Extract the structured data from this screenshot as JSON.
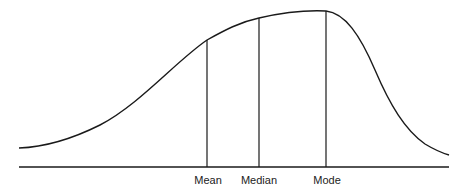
{
  "diagram": {
    "type": "negatively-skewed-distribution",
    "line_color": "#1a1a1a",
    "markers": [
      {
        "label": "Mean",
        "x": 207,
        "top": 40
      },
      {
        "label": "Median",
        "x": 259,
        "top": 18
      },
      {
        "label": "Mode",
        "x": 326,
        "top": 11
      }
    ]
  }
}
